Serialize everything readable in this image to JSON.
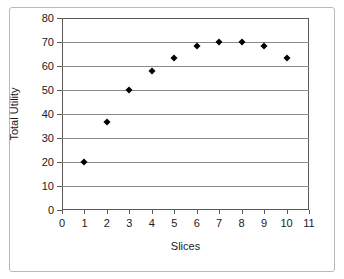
{
  "chart_data": {
    "type": "scatter",
    "title": "",
    "xlabel": "Slices",
    "ylabel": "Total Utility",
    "xlim": [
      0,
      11
    ],
    "ylim": [
      0,
      80
    ],
    "xticks": [
      0,
      1,
      2,
      3,
      4,
      5,
      6,
      7,
      8,
      9,
      10,
      11
    ],
    "yticks": [
      0,
      10,
      20,
      30,
      40,
      50,
      60,
      70,
      80
    ],
    "grid": "horizontal",
    "legend": "none",
    "marker": "diamond",
    "marker_color": "#000000",
    "x": [
      1,
      2,
      3,
      4,
      5,
      6,
      7,
      8,
      9,
      10
    ],
    "values": [
      20,
      36.5,
      50,
      58,
      63.5,
      68.3,
      70,
      70,
      68.3,
      63.5
    ],
    "points": [
      {
        "x": 1,
        "y": 20
      },
      {
        "x": 2,
        "y": 36.5
      },
      {
        "x": 3,
        "y": 50
      },
      {
        "x": 4,
        "y": 58
      },
      {
        "x": 5,
        "y": 63.5
      },
      {
        "x": 6,
        "y": 68.3
      },
      {
        "x": 7,
        "y": 70
      },
      {
        "x": 8,
        "y": 70
      },
      {
        "x": 9,
        "y": 68.3
      },
      {
        "x": 10,
        "y": 63.5
      }
    ]
  },
  "axes": {
    "y_title": "Total Utility",
    "x_title": "Slices",
    "y_tick_labels": [
      "0",
      "10",
      "20",
      "30",
      "40",
      "50",
      "60",
      "70",
      "80"
    ],
    "x_tick_labels": [
      "0",
      "1",
      "2",
      "3",
      "4",
      "5",
      "6",
      "7",
      "8",
      "9",
      "10",
      "11"
    ]
  },
  "style": {
    "gridline_color": "#8a8a8a",
    "axis_color": "#5a5a5a",
    "frame_color": "#b9b9b9",
    "text_color": "#1a1a1a",
    "background": "#ffffff"
  }
}
